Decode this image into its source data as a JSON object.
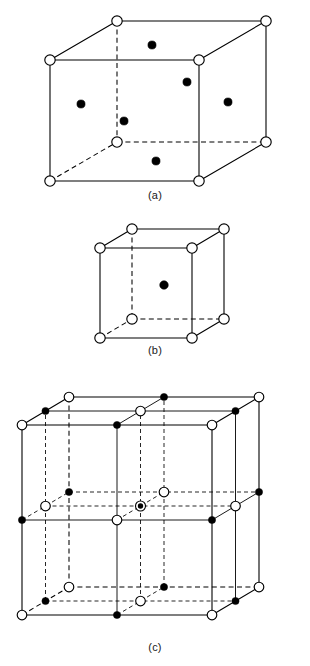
{
  "figure": {
    "kind": "crystal-structure-diagram",
    "panels": [
      {
        "id": "a",
        "caption": "(a)",
        "structure": "face-centred cubic unit cell",
        "open_circle_count": 8,
        "filled_dot_count": 6
      },
      {
        "id": "b",
        "caption": "(b)",
        "structure": "body-centred cubic unit cell",
        "open_circle_count": 8,
        "filled_dot_count": 1
      },
      {
        "id": "c",
        "caption": "(c)",
        "structure": "rock-salt type 2x2x2 lattice",
        "symbols": [
          "open-circle",
          "filled-dot",
          "concentric-circle"
        ]
      }
    ]
  },
  "chart_data": {
    "type": "scatter",
    "title": "",
    "xlabel": "",
    "ylabel": "",
    "legend": [
      {
        "symbol": "open-circle",
        "label": ""
      },
      {
        "symbol": "filled-dot",
        "label": ""
      },
      {
        "symbol": "concentric-circle",
        "label": ""
      }
    ],
    "panels": [
      {
        "id": "a",
        "caption": "(a)",
        "projection": {
          "ox": 67,
          "oy": -39
        },
        "cube": {
          "x": 50,
          "y": 60,
          "w": 149,
          "h": 121
        },
        "corner_points": [
          {
            "x": 50,
            "y": 60,
            "type": "open"
          },
          {
            "x": 199,
            "y": 60,
            "type": "open"
          },
          {
            "x": 50,
            "y": 181,
            "type": "open"
          },
          {
            "x": 199,
            "y": 181,
            "type": "open"
          },
          {
            "x": 117,
            "y": 21,
            "type": "open"
          },
          {
            "x": 266,
            "y": 21,
            "type": "open"
          },
          {
            "x": 117,
            "y": 142,
            "type": "open"
          },
          {
            "x": 266,
            "y": 142,
            "type": "open"
          }
        ],
        "face_points": [
          {
            "x": 152,
            "y": 45,
            "type": "filled"
          },
          {
            "x": 187,
            "y": 82,
            "type": "filled"
          },
          {
            "x": 81,
            "y": 104,
            "type": "filled"
          },
          {
            "x": 228,
            "y": 102,
            "type": "filled"
          },
          {
            "x": 124,
            "y": 121,
            "type": "filled"
          },
          {
            "x": 156,
            "y": 161,
            "type": "filled"
          }
        ],
        "hidden_edges": [
          [
            117,
            21,
            117,
            142
          ],
          [
            117,
            142,
            266,
            142
          ],
          [
            50,
            181,
            117,
            142
          ]
        ]
      },
      {
        "id": "b",
        "caption": "(b)",
        "projection": {
          "ox": 32,
          "oy": -19
        },
        "cube": {
          "x": 100,
          "y": 248,
          "w": 92,
          "h": 90
        },
        "corner_points": [
          {
            "x": 100,
            "y": 248,
            "type": "open"
          },
          {
            "x": 192,
            "y": 248,
            "type": "open"
          },
          {
            "x": 100,
            "y": 338,
            "type": "open"
          },
          {
            "x": 192,
            "y": 338,
            "type": "open"
          },
          {
            "x": 132,
            "y": 229,
            "type": "open"
          },
          {
            "x": 224,
            "y": 229,
            "type": "open"
          },
          {
            "x": 132,
            "y": 319,
            "type": "open"
          },
          {
            "x": 224,
            "y": 319,
            "type": "open"
          }
        ],
        "centre_points": [
          {
            "x": 164,
            "y": 285,
            "type": "filled"
          }
        ],
        "hidden_edges": [
          [
            132,
            229,
            132,
            319
          ],
          [
            132,
            319,
            224,
            319
          ],
          [
            100,
            338,
            132,
            319
          ]
        ]
      },
      {
        "id": "c",
        "caption": "(c)",
        "projection": {
          "ox": 47,
          "oy": -28
        },
        "cube": {
          "x": 22,
          "y": 425,
          "w": 190,
          "h": 190
        },
        "divisions": 2,
        "sublattice_a": "open-circle",
        "sublattice_b": "filled-dot",
        "interior_marker": "concentric-circle"
      }
    ]
  }
}
